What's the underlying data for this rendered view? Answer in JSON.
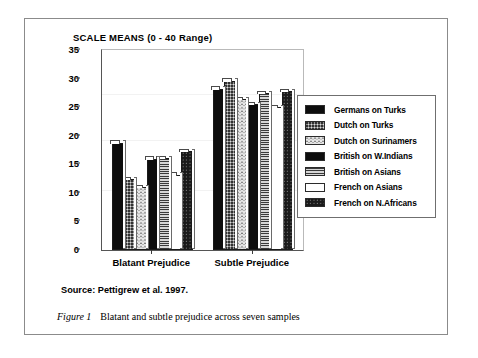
{
  "chart_data": {
    "type": "bar",
    "title": "SCALE MEANS (0 - 40 Range)",
    "xlabel": "",
    "ylabel": "",
    "ylim": [
      0,
      35
    ],
    "yticks": [
      0,
      5,
      10,
      15,
      20,
      25,
      30,
      35
    ],
    "grid": false,
    "legend_position": "right",
    "categories": [
      "Blatant Prejudice",
      "Subtle Prejudice"
    ],
    "series": [
      {
        "name": "Germans on Turks",
        "pattern": "solid-black",
        "color": "#0d0d0d",
        "values": [
          18.8,
          28.2
        ]
      },
      {
        "name": "Dutch on Turks",
        "pattern": "gray-dots",
        "color": "#8e8e8e",
        "values": [
          12.4,
          29.6
        ]
      },
      {
        "name": "Dutch on Surinamers",
        "pattern": "light-speckle",
        "color": "#e7e7e7",
        "values": [
          11.0,
          26.4
        ]
      },
      {
        "name": "British on W.Indians",
        "pattern": "solid-black",
        "color": "#0d0d0d",
        "values": [
          16.0,
          25.5
        ]
      },
      {
        "name": "British on Asians",
        "pattern": "gray-hlines",
        "color": "#b0b0b0",
        "values": [
          16.1,
          27.4
        ]
      },
      {
        "name": "French on Asians",
        "pattern": "white",
        "color": "#ffffff",
        "values": [
          13.2,
          25.0
        ]
      },
      {
        "name": "French on N.Africans",
        "pattern": "dark-speckle",
        "color": "#1a1a1a",
        "values": [
          17.3,
          27.8
        ]
      }
    ]
  },
  "source": {
    "text": "Source: Pettigrew et al. 1997."
  },
  "caption": {
    "figure_number": "Figure 1",
    "text": "Blatant and subtle prejudice across seven samples"
  }
}
